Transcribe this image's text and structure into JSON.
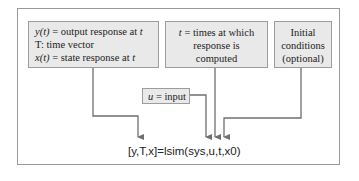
{
  "diagram": {
    "outputs_box": {
      "lines": [
        {
          "var": "y(t)",
          "text": " = output response at ",
          "tail": "t"
        },
        {
          "var": "",
          "text": "T: time vector",
          "tail": ""
        },
        {
          "var": "x(t)",
          "text": " = state response at ",
          "tail": "t"
        }
      ]
    },
    "times_box": {
      "var": "t",
      "lines": [
        " = times at which",
        "response is",
        "computed"
      ]
    },
    "initial_box": {
      "lines": [
        "Initial",
        "conditions",
        "(optional)"
      ]
    },
    "input_box": {
      "var": "u",
      "text": " = input"
    },
    "formula": "[y,T,x]=lsim(sys,u,t,x0)",
    "colors": {
      "box_fill": "#e9e9e9",
      "box_border": "#9c9c9c",
      "arrow": "#6f6f6f",
      "frame": "#9a9a9a"
    }
  }
}
